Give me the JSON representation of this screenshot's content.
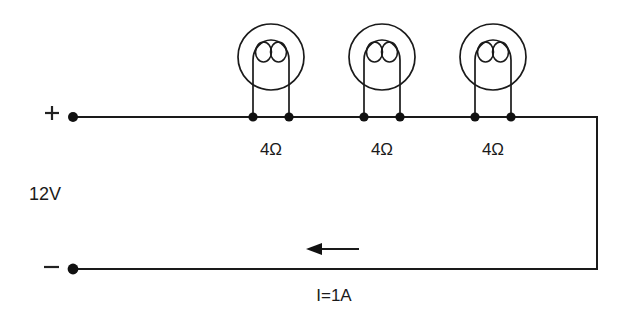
{
  "diagram": {
    "type": "series-circuit-schematic",
    "source": {
      "voltage_label": "12V",
      "positive_terminal_symbol": "+",
      "negative_terminal_symbol": "−"
    },
    "current": {
      "label": "I=1A",
      "direction": "left"
    },
    "lamps": [
      {
        "id": "lamp-1",
        "resistance_label": "4Ω",
        "cx": 271,
        "cy": 57,
        "r": 33
      },
      {
        "id": "lamp-2",
        "resistance_label": "4Ω",
        "cx": 382,
        "cy": 57,
        "r": 33
      },
      {
        "id": "lamp-3",
        "resistance_label": "4Ω",
        "cx": 493,
        "cy": 57,
        "r": 33
      }
    ],
    "nodes": [
      {
        "id": "node-pos-terminal",
        "x": 73,
        "y": 117
      },
      {
        "id": "node-lamp1-left",
        "x": 253,
        "y": 117
      },
      {
        "id": "node-lamp1-right",
        "x": 289,
        "y": 117
      },
      {
        "id": "node-lamp2-left",
        "x": 364,
        "y": 117
      },
      {
        "id": "node-lamp2-right",
        "x": 400,
        "y": 117
      },
      {
        "id": "node-lamp3-left",
        "x": 475,
        "y": 117
      },
      {
        "id": "node-lamp3-right",
        "x": 511,
        "y": 117
      },
      {
        "id": "node-neg-terminal",
        "x": 73,
        "y": 269
      }
    ],
    "colors": {
      "ink": "#1a1a1a",
      "background": "#ffffff",
      "node_fill": "#111111"
    }
  }
}
